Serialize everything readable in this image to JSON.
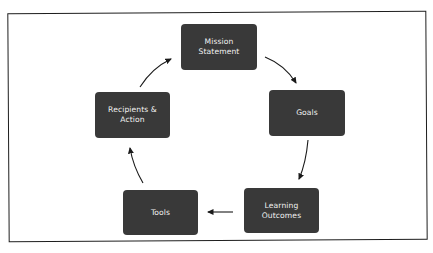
{
  "diagram": {
    "type": "cycle",
    "colors": {
      "node_fill": "#393939",
      "node_text": "#f2f2f2",
      "arrow": "#1a1a1a",
      "frame": "#1e1e1e",
      "background": "#ffffff"
    },
    "nodes": [
      {
        "id": "mission",
        "label": "Mission Statement",
        "lines": [
          "Mission",
          "Statement"
        ]
      },
      {
        "id": "goals",
        "label": "Goals",
        "lines": [
          "Goals"
        ]
      },
      {
        "id": "learning",
        "label": "Learning Outcomes",
        "lines": [
          "Learning",
          "Outcomes"
        ]
      },
      {
        "id": "tools",
        "label": "Tools",
        "lines": [
          "Tools"
        ]
      },
      {
        "id": "recipients",
        "label": "Recipients & Action",
        "lines": [
          "Recipients &",
          "Action"
        ]
      }
    ],
    "edges": [
      {
        "from": "mission",
        "to": "goals"
      },
      {
        "from": "goals",
        "to": "learning"
      },
      {
        "from": "learning",
        "to": "tools"
      },
      {
        "from": "tools",
        "to": "recipients"
      },
      {
        "from": "recipients",
        "to": "mission"
      }
    ]
  }
}
